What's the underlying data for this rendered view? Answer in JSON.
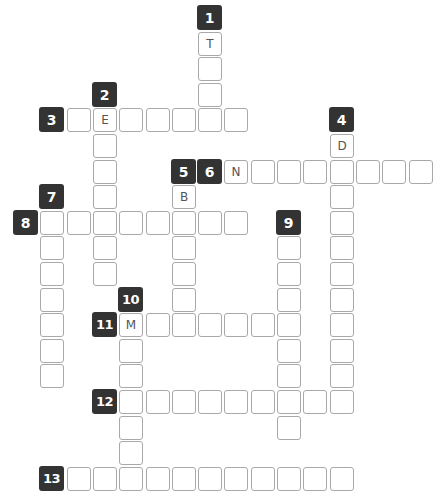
{
  "puzzle": {
    "grid": {
      "origin_x": 13,
      "origin_y": 5,
      "pitch_x": 26.3,
      "pitch_y": 25.6
    },
    "colors": {
      "label_bg": "#333333",
      "label_text": "#ffffff",
      "cell_border": "#a9a9a9",
      "letter": "#555555"
    },
    "words": [
      {
        "number": "1",
        "direction": "down",
        "label": [
          7,
          0
        ],
        "start": [
          7,
          1
        ],
        "length": 4,
        "given": {
          "0": "T"
        }
      },
      {
        "number": "2",
        "direction": "down",
        "label": [
          3,
          3
        ],
        "start": [
          3,
          4
        ],
        "length": 7,
        "given": {
          "0": "E"
        }
      },
      {
        "number": "3",
        "direction": "across",
        "label": [
          1,
          4
        ],
        "start": [
          2,
          4
        ],
        "length": 7,
        "given": {
          "1": "E"
        }
      },
      {
        "number": "4",
        "direction": "down",
        "label": [
          12,
          4
        ],
        "start": [
          12,
          5
        ],
        "length": 11,
        "given": {
          "0": "D"
        }
      },
      {
        "number": "5",
        "direction": "down",
        "label": [
          6,
          6
        ],
        "start": [
          6,
          7
        ],
        "length": 5,
        "given": {
          "0": "B"
        }
      },
      {
        "number": "6",
        "direction": "across",
        "label": [
          7,
          6
        ],
        "start": [
          8,
          6
        ],
        "length": 8,
        "given": {
          "0": "N"
        }
      },
      {
        "number": "7",
        "direction": "down",
        "label": [
          1,
          7
        ],
        "start": [
          1,
          8
        ],
        "length": 7,
        "given": {}
      },
      {
        "number": "8",
        "direction": "across",
        "label": [
          0,
          8
        ],
        "start": [
          1,
          8
        ],
        "length": 8,
        "given": {}
      },
      {
        "number": "9",
        "direction": "down",
        "label": [
          10,
          8
        ],
        "start": [
          10,
          9
        ],
        "length": 8,
        "given": {}
      },
      {
        "number": "10",
        "direction": "down",
        "label": [
          4,
          11
        ],
        "start": [
          4,
          12
        ],
        "length": 6,
        "given": {
          "0": "M"
        }
      },
      {
        "number": "11",
        "direction": "across",
        "label": [
          3,
          12
        ],
        "start": [
          4,
          12
        ],
        "length": 7,
        "given": {
          "0": "M"
        }
      },
      {
        "number": "12",
        "direction": "across",
        "label": [
          3,
          15
        ],
        "start": [
          4,
          15
        ],
        "length": 9,
        "given": {}
      },
      {
        "number": "13",
        "direction": "across",
        "label": [
          1,
          18
        ],
        "start": [
          2,
          18
        ],
        "length": 11,
        "given": {}
      }
    ]
  }
}
